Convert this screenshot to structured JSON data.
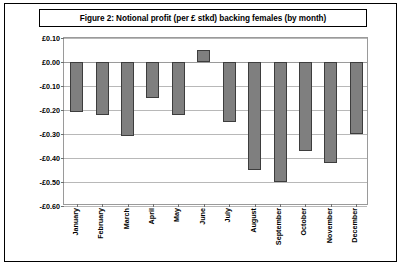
{
  "figure": {
    "title": "Figure 2: Notional profit (per £ stkd) backing females (by month)"
  },
  "chart_data": {
    "type": "bar",
    "title": "Figure 2: Notional profit (per £ stkd) backing females (by month)",
    "xlabel": "",
    "ylabel": "",
    "categories": [
      "January",
      "February",
      "March",
      "April",
      "May",
      "June",
      "July",
      "August",
      "September",
      "October",
      "November",
      "December"
    ],
    "values": [
      -0.21,
      -0.22,
      -0.31,
      -0.15,
      -0.22,
      0.05,
      -0.25,
      -0.45,
      -0.5,
      -0.37,
      -0.42,
      -0.3
    ],
    "ylim": [
      -0.6,
      0.1
    ],
    "ytick_values": [
      0.1,
      0.0,
      -0.1,
      -0.2,
      -0.3,
      -0.4,
      -0.5,
      -0.6
    ],
    "ytick_labels": [
      "£0.10",
      "£0.00",
      "-£0.10",
      "-£0.20",
      "-£0.30",
      "-£0.40",
      "-£0.50",
      "-£0.60"
    ],
    "grid": true,
    "legend": false,
    "legend_position": "none",
    "bar_color": "#7f7f7f",
    "bar_border_color": "#3d3d3d",
    "gridline_color": "#b8b8b8",
    "plot_border_color": "#9a9a9a",
    "frame_color": "#000000",
    "background_color": "#ffffff"
  }
}
